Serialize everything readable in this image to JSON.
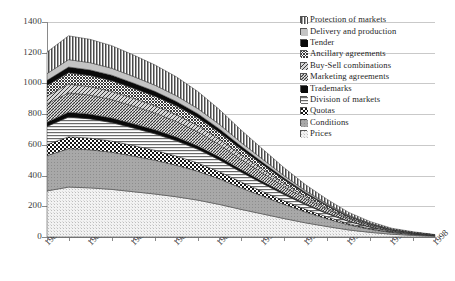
{
  "chart_data": {
    "type": "area",
    "stacked": true,
    "title": "",
    "xlabel": "",
    "ylabel": "",
    "grid": true,
    "legend_position": "top-right",
    "xlim": [
      1980,
      1998
    ],
    "ylim": [
      0,
      1400
    ],
    "yticks": [
      0,
      200,
      400,
      600,
      800,
      1000,
      1200,
      1400
    ],
    "xticks": [
      1980,
      1982,
      1984,
      1986,
      1988,
      1990,
      1992,
      1994,
      1996,
      1998
    ],
    "xtick_labels": [
      "1980",
      "1982",
      "1984",
      "1986",
      "1988",
      "1990",
      "1992",
      "1994",
      "1996",
      "1998"
    ],
    "ytick_labels": [
      "0",
      "200",
      "400",
      "600",
      "800",
      "1000",
      "1200",
      "1400"
    ],
    "x": [
      1980,
      1981,
      1982,
      1983,
      1984,
      1985,
      1986,
      1987,
      1988,
      1989,
      1990,
      1991,
      1992,
      1993,
      1994,
      1995,
      1996,
      1997,
      1998
    ],
    "series": [
      {
        "name": "Prices",
        "pattern": "fine-dots-light",
        "values": [
          300,
          325,
          320,
          310,
          295,
          280,
          262,
          240,
          212,
          180,
          150,
          120,
          92,
          68,
          46,
          30,
          18,
          10,
          5
        ]
      },
      {
        "name": "Conditions",
        "pattern": "mid-gray-dots",
        "values": [
          230,
          250,
          248,
          242,
          232,
          220,
          205,
          188,
          166,
          140,
          116,
          92,
          70,
          50,
          33,
          20,
          11,
          6,
          3
        ]
      },
      {
        "name": "Quotas",
        "pattern": "checkerboard",
        "values": [
          72,
          78,
          76,
          73,
          69,
          65,
          60,
          54,
          47,
          39,
          31,
          24,
          18,
          13,
          8,
          5,
          3,
          2,
          1
        ]
      },
      {
        "name": "Division of markets",
        "pattern": "horizontal-lines",
        "values": [
          118,
          128,
          125,
          120,
          114,
          107,
          99,
          89,
          77,
          64,
          52,
          40,
          30,
          21,
          14,
          9,
          5,
          3,
          1
        ]
      },
      {
        "name": "Trademarks",
        "pattern": "solid-black",
        "values": [
          28,
          32,
          31,
          30,
          28,
          27,
          25,
          22,
          19,
          16,
          13,
          10,
          7,
          5,
          3,
          2,
          1,
          1,
          0
        ]
      },
      {
        "name": "Marketing agreements",
        "pattern": "diagonal-cross",
        "values": [
          118,
          126,
          124,
          120,
          115,
          109,
          101,
          92,
          80,
          67,
          55,
          43,
          32,
          23,
          15,
          9,
          5,
          3,
          1
        ]
      },
      {
        "name": "Buy-Sell combinations",
        "pattern": "wide-diagonal",
        "values": [
          52,
          56,
          55,
          53,
          50,
          47,
          44,
          40,
          35,
          29,
          24,
          19,
          14,
          10,
          6,
          4,
          2,
          1,
          1
        ]
      },
      {
        "name": "Ancillary agreements",
        "pattern": "dense-grid",
        "values": [
          68,
          74,
          72,
          70,
          66,
          62,
          58,
          52,
          45,
          38,
          31,
          24,
          18,
          13,
          8,
          5,
          3,
          2,
          1
        ]
      },
      {
        "name": "Tender",
        "pattern": "solid-black",
        "values": [
          34,
          38,
          37,
          36,
          34,
          32,
          29,
          26,
          23,
          19,
          15,
          12,
          9,
          6,
          4,
          2,
          1,
          1,
          0
        ]
      },
      {
        "name": "Delivery and production",
        "pattern": "light-gray",
        "values": [
          44,
          48,
          47,
          45,
          43,
          40,
          37,
          33,
          29,
          24,
          20,
          15,
          11,
          8,
          5,
          3,
          2,
          1,
          1
        ]
      },
      {
        "name": "Protection of markets",
        "pattern": "vertical-lines",
        "values": [
          140,
          155,
          152,
          147,
          140,
          132,
          123,
          111,
          97,
          81,
          66,
          52,
          39,
          28,
          18,
          11,
          6,
          4,
          2
        ]
      }
    ]
  },
  "legend": {
    "items": [
      {
        "label": "Protection of markets",
        "pattern": "vertical-lines"
      },
      {
        "label": "Delivery and production",
        "pattern": "light-gray"
      },
      {
        "label": "Tender",
        "pattern": "solid-black"
      },
      {
        "label": "Ancillary agreements",
        "pattern": "dense-grid"
      },
      {
        "label": "Buy-Sell combinations",
        "pattern": "wide-diagonal"
      },
      {
        "label": "Marketing agreements",
        "pattern": "diagonal-cross"
      },
      {
        "label": "Trademarks",
        "pattern": "solid-black"
      },
      {
        "label": "Division of markets",
        "pattern": "horizontal-lines"
      },
      {
        "label": "Quotas",
        "pattern": "checkerboard"
      },
      {
        "label": "Conditions",
        "pattern": "mid-gray-dots"
      },
      {
        "label": "Prices",
        "pattern": "fine-dots-light"
      }
    ]
  },
  "colors": {
    "axis": "#8a8a8a",
    "grid": "#c9c9c9",
    "text": "#2b2b2b",
    "black": "#000000",
    "background": "#ffffff"
  }
}
